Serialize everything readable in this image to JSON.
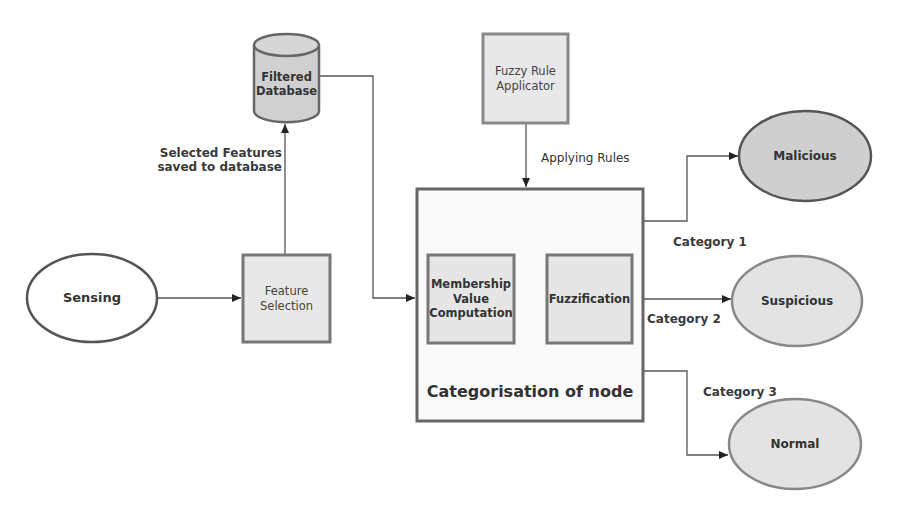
{
  "diagram": {
    "nodes": {
      "sensing": {
        "label": "Sensing",
        "shape": "ellipse",
        "fill": "#ffffff"
      },
      "feature_selection": {
        "label_line1": "Feature",
        "label_line2": "Selection",
        "shape": "rect",
        "fill": "#e8e8e8"
      },
      "filtered_database": {
        "label_line1": "Filtered",
        "label_line2": "Database",
        "shape": "cylinder",
        "fill": "#d0d0d0"
      },
      "fuzzy_rule_applicator": {
        "label_line1": "Fuzzy Rule",
        "label_line2": "Applicator",
        "shape": "rect",
        "fill": "#e8e8e8"
      },
      "categorisation": {
        "label": "Categorisation of node",
        "shape": "rect",
        "fill": "#fafafa"
      },
      "membership": {
        "label_line1": "Membership",
        "label_line2": "Value",
        "label_line3": "Computation",
        "shape": "rect",
        "fill": "#e6e6e6"
      },
      "fuzzification": {
        "label": "Fuzzification",
        "shape": "rect",
        "fill": "#e6e6e6"
      },
      "malicious": {
        "label": "Malicious",
        "shape": "ellipse",
        "fill": "#cfcfcf"
      },
      "suspicious": {
        "label": "Suspicious",
        "shape": "ellipse",
        "fill": "#e3e3e3"
      },
      "normal": {
        "label": "Normal",
        "shape": "ellipse",
        "fill": "#e3e3e3"
      }
    },
    "edge_labels": {
      "selected_features_line1": "Selected Features",
      "selected_features_line2": "saved to database",
      "applying_rules": "Applying Rules",
      "category_1": "Category 1",
      "category_2": "Category 2",
      "category_3": "Category 3"
    },
    "edges": [
      {
        "from": "Sensing",
        "to": "Feature Selection"
      },
      {
        "from": "Feature Selection",
        "to": "Filtered Database",
        "label": "Selected Features saved to database"
      },
      {
        "from": "Filtered Database",
        "to": "Categorisation of node"
      },
      {
        "from": "Fuzzy Rule Applicator",
        "to": "Categorisation of node",
        "label": "Applying Rules"
      },
      {
        "from": "Categorisation of node",
        "to": "Malicious",
        "label": "Category 1"
      },
      {
        "from": "Categorisation of node",
        "to": "Suspicious",
        "label": "Category 2"
      },
      {
        "from": "Categorisation of node",
        "to": "Normal",
        "label": "Category 3"
      }
    ],
    "colors": {
      "stroke": "#666666",
      "line": "#555555",
      "text": "#333333"
    }
  }
}
